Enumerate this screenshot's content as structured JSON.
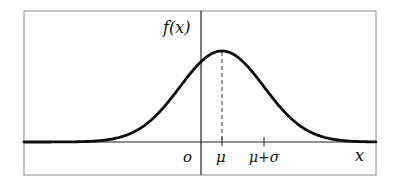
{
  "chart_data": {
    "type": "line",
    "title": "",
    "ylabel": "f(x)",
    "xlabel": "x",
    "origin_label": "o",
    "tick_labels": [
      "μ",
      "μ+σ"
    ],
    "annotations": [
      {
        "type": "dashed-vertical-line",
        "at": "μ",
        "meaning": "axis of symmetry at mean"
      },
      {
        "type": "tick",
        "at": "μ+σ"
      }
    ],
    "series": [
      {
        "name": "f(x)",
        "mu": 0.5,
        "sigma": 1,
        "x": [
          -4.0,
          -3.5,
          -3.0,
          -2.5,
          -2.0,
          -1.5,
          -1.0,
          -0.5,
          0.0,
          0.5,
          1.0,
          1.5,
          2.0,
          2.5,
          3.0,
          3.5,
          4.0
        ],
        "values": [
          0.0,
          0.0001,
          0.0009,
          0.0044,
          0.0175,
          0.054,
          0.1295,
          0.242,
          0.3521,
          0.3989,
          0.3521,
          0.242,
          0.1295,
          0.054,
          0.0175,
          0.0044,
          0.0009
        ]
      }
    ],
    "grid": false,
    "legend": null
  },
  "labels": {
    "y_axis": "f(x)",
    "x_axis": "x",
    "origin": "o",
    "mu": "μ",
    "mu_plus_sigma": "μ+σ"
  },
  "colors": {
    "curve": "#0d0d0d",
    "axes": "#222222",
    "frame": "#8c8c8c"
  }
}
